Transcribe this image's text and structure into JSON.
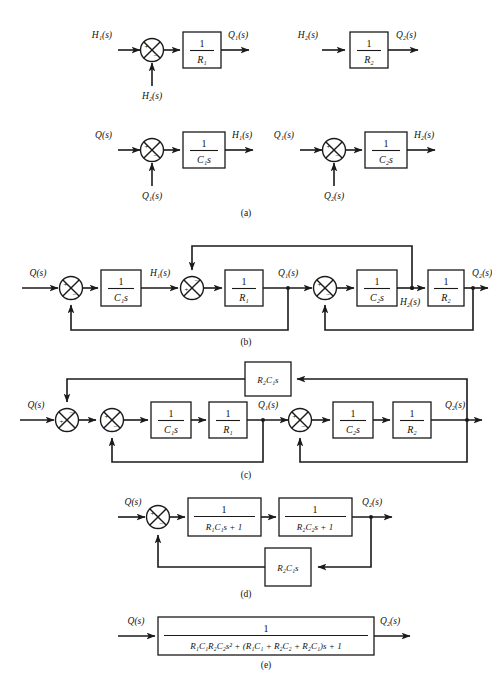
{
  "figure": {
    "top_cut_text": "",
    "captions": [
      {
        "id": "cap-a",
        "label": "(a)"
      },
      {
        "id": "cap-b",
        "label": "(b)"
      },
      {
        "id": "cap-c",
        "label": "(c)"
      },
      {
        "id": "cap-d",
        "label": "(d)"
      },
      {
        "id": "cap-e",
        "label": "(e)"
      }
    ],
    "signals": {
      "Q": "Q",
      "Q1": "Q",
      "Q2": "Q",
      "H1": "H",
      "H2": "H",
      "s_paren": "(s)",
      "sub1": "1",
      "sub2": "2"
    },
    "signs": {
      "plus": "+",
      "minus": "−"
    },
    "one": "1",
    "panel_a": {
      "sub1": {
        "input_left": "H₁(s)",
        "input_bottom": "H₂(s)",
        "block_num": "1",
        "block_den": "R₁",
        "output": "Q₁(s)",
        "sign_left": "+",
        "sign_bottom": "−"
      },
      "sub2": {
        "input_left": "H₂(s)",
        "block_num": "1",
        "block_den": "R₂",
        "output": "Q₂(s)"
      },
      "sub3": {
        "input_left": "Q(s)",
        "input_bottom": "Q₁(s)",
        "block_num": "1",
        "block_den": "C₁s",
        "output": "H₁(s)",
        "sign_left": "+",
        "sign_bottom": "−"
      },
      "sub4": {
        "input_left": "Q₁(s)",
        "input_bottom": "Q₂(s)",
        "block_num": "1",
        "block_den": "C₂s",
        "output": "H₂(s)",
        "sign_left": "+",
        "sign_bottom": "−"
      }
    },
    "panel_b": {
      "input": "Q(s)",
      "output": "Q₂(s)",
      "node_h1": "H₁(s)",
      "node_q1": "Q₁(s)",
      "node_h2": "H₂(s)",
      "blocks": [
        {
          "num": "1",
          "den": "C₁s"
        },
        {
          "num": "1",
          "den": "R₁"
        },
        {
          "num": "1",
          "den": "C₂s"
        },
        {
          "num": "1",
          "den": "R₂"
        }
      ],
      "junctions": [
        {
          "left": "+",
          "bottom": "−"
        },
        {
          "left": "+",
          "top": "−"
        },
        {
          "left": "+",
          "bottom": "−"
        }
      ]
    },
    "panel_c": {
      "input": "Q(s)",
      "output": "Q₂(s)",
      "node_q1": "Q₁(s)",
      "feedback_block": "R₂C₁s",
      "blocks": [
        {
          "num": "1",
          "den": "C₁s"
        },
        {
          "num": "1",
          "den": "R₁"
        },
        {
          "num": "1",
          "den": "C₂s"
        },
        {
          "num": "1",
          "den": "R₂"
        }
      ],
      "junctions": [
        {
          "left": "+",
          "top": "−"
        },
        {
          "left": "+",
          "bottom": "−"
        },
        {
          "left": "+",
          "bottom": "−"
        }
      ]
    },
    "panel_d": {
      "input": "Q(s)",
      "output": "Q₂(s)",
      "blocks": [
        {
          "num": "1",
          "den": "R₁C₁s + 1"
        },
        {
          "num": "1",
          "den": "R₂C₂s + 1"
        }
      ],
      "feedback_block": "R₂C₁s",
      "junction": {
        "left": "+",
        "bottom": "−"
      }
    },
    "panel_e": {
      "input": "Q(s)",
      "output": "Q₂(s)",
      "block_num": "1",
      "block_den": "R₁C₁R₂C₂s² + (R₁C₁ + R₂C₂ + R₂C₁)s + 1"
    }
  }
}
